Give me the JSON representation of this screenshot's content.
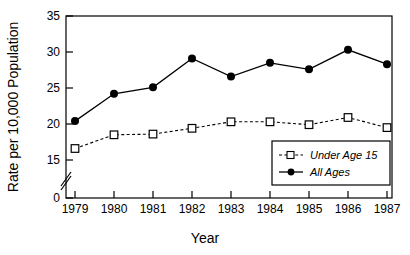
{
  "chart_data": {
    "type": "line",
    "title": "",
    "xlabel": "Year",
    "ylabel": "Rate per 10,000 Population",
    "categories": [
      "1979",
      "1980",
      "1981",
      "1982",
      "1983",
      "1984",
      "1985",
      "1986",
      "1987"
    ],
    "x": [
      1979,
      1980,
      1981,
      1982,
      1983,
      1984,
      1985,
      1986,
      1987
    ],
    "series": [
      {
        "name": "Under Age 15",
        "marker": "open-square",
        "linestyle": "dashed",
        "color": "#000000",
        "values": [
          16.6,
          18.5,
          18.6,
          19.4,
          20.3,
          20.3,
          19.9,
          20.9,
          19.5
        ]
      },
      {
        "name": "All Ages",
        "marker": "filled-circle",
        "linestyle": "solid",
        "color": "#000000",
        "values": [
          20.4,
          24.2,
          25.1,
          29.1,
          26.6,
          28.5,
          27.6,
          30.3,
          28.3
        ]
      }
    ],
    "ylim": [
      0,
      35
    ],
    "yticks": [
      0,
      15,
      20,
      25,
      30,
      35
    ],
    "ytick_labels": [
      "0",
      "15",
      "20",
      "25",
      "30",
      "35"
    ],
    "y_axis_break": true,
    "y_axis_break_between": [
      0,
      15
    ],
    "xlim": [
      1978.6,
      1987.6
    ],
    "grid": false,
    "legend_position": "lower right",
    "legend_entries": [
      "Under Age 15",
      "All Ages"
    ]
  },
  "axes": {
    "y_label": "Rate per 10,000 Population",
    "x_label": "Year",
    "y_ticks": [
      "35",
      "30",
      "25",
      "20",
      "15",
      "0"
    ],
    "x_ticks": [
      "1979",
      "1980",
      "1981",
      "1982",
      "1983",
      "1984",
      "1985",
      "1986",
      "1987"
    ]
  },
  "legend": {
    "items": [
      {
        "label": "Under Age 15"
      },
      {
        "label": "All Ages"
      }
    ]
  }
}
